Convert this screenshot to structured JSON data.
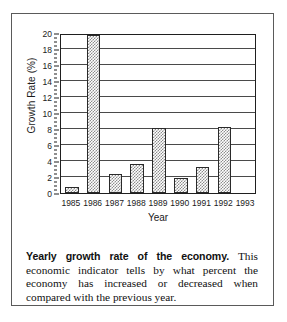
{
  "figure": {
    "caption_lead": "Yearly growth rate of the economy.",
    "caption_body": " This economic indicator tells by what percent the economy has increased or decreased when compared with the previous year."
  },
  "chart_data": {
    "type": "bar",
    "title": "",
    "xlabel": "Year",
    "ylabel": "Growth Rate (%)",
    "categories": [
      "1985",
      "1986",
      "1987",
      "1988",
      "1989",
      "1990",
      "1991",
      "1992",
      "1993"
    ],
    "values": [
      0.8,
      19.8,
      2.4,
      3.6,
      8.1,
      1.9,
      3.2,
      8.2,
      0
    ],
    "ylim": [
      0,
      20
    ],
    "yticks": [
      0,
      2,
      4,
      6,
      8,
      10,
      12,
      14,
      16,
      18,
      20
    ],
    "ytick_labels": [
      "0",
      "2",
      "4",
      "6",
      "8",
      "10",
      "12",
      "14",
      "16",
      "18",
      "20"
    ],
    "minor_ytick_step": 0.5,
    "grid": "horizontal",
    "legend": "none",
    "bar_fill": "stipple-gray",
    "bar_edge_color": "#2a2a2a",
    "axis_color": "#1f1f1f",
    "grid_color": "#4a4a4a",
    "background": "#ffffff"
  }
}
